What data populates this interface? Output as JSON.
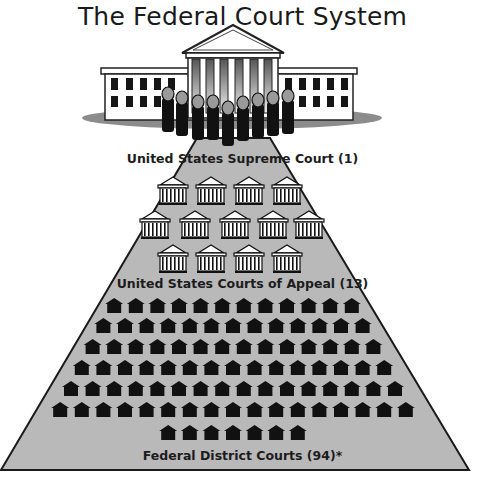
{
  "title": "The Federal Court System",
  "colors": {
    "pyramid_fill": "#b9b9b9",
    "pyramid_stroke": "#1a1a1a",
    "icon_dark": "#111111",
    "justice_head": "#9a9a9a",
    "shadow": "#8c8c8c"
  },
  "tiers": [
    {
      "id": "supreme",
      "label": "United States Supreme Court (1)",
      "count": 1,
      "icon": "supreme-court-building-icon",
      "justices": 9
    },
    {
      "id": "appeals",
      "label": "United States Courts of Appeal (13)",
      "count": 13,
      "icon": "courthouse-icon",
      "rows": [
        4,
        5,
        4
      ]
    },
    {
      "id": "district",
      "label": "Federal District Courts (94)*",
      "count": 94,
      "icon": "house-icon",
      "rows": [
        12,
        13,
        14,
        15,
        16,
        17,
        7
      ]
    }
  ]
}
